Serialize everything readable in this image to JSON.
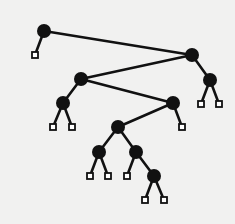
{
  "diagram": {
    "type": "binary-tree",
    "background": "#f1f1f0",
    "ink": "#111111",
    "leaf_fill": "#ffffff",
    "internal_node_radius": 7,
    "leaf_size": 6,
    "edge_width": 2.6,
    "internal_nodes": [
      {
        "id": "A",
        "x": 44,
        "y": 31
      },
      {
        "id": "B",
        "x": 192,
        "y": 55
      },
      {
        "id": "C",
        "x": 81,
        "y": 79
      },
      {
        "id": "D",
        "x": 210,
        "y": 80
      },
      {
        "id": "E",
        "x": 63,
        "y": 103
      },
      {
        "id": "F",
        "x": 173,
        "y": 103
      },
      {
        "id": "G",
        "x": 118,
        "y": 127
      },
      {
        "id": "H",
        "x": 99,
        "y": 152
      },
      {
        "id": "I",
        "x": 136,
        "y": 152
      },
      {
        "id": "J",
        "x": 154,
        "y": 176
      }
    ],
    "leaves": [
      {
        "id": "L1",
        "x": 35,
        "y": 55
      },
      {
        "id": "L2",
        "x": 201,
        "y": 104
      },
      {
        "id": "L3",
        "x": 219,
        "y": 104
      },
      {
        "id": "L4",
        "x": 53,
        "y": 127
      },
      {
        "id": "L5",
        "x": 72,
        "y": 127
      },
      {
        "id": "L6",
        "x": 182,
        "y": 127
      },
      {
        "id": "L7",
        "x": 90,
        "y": 176
      },
      {
        "id": "L8",
        "x": 108,
        "y": 176
      },
      {
        "id": "L9",
        "x": 127,
        "y": 176
      },
      {
        "id": "L10",
        "x": 145,
        "y": 200
      },
      {
        "id": "L11",
        "x": 164,
        "y": 200
      }
    ],
    "edges": [
      [
        "A",
        "L1"
      ],
      [
        "A",
        "B"
      ],
      [
        "B",
        "C"
      ],
      [
        "B",
        "D"
      ],
      [
        "D",
        "L2"
      ],
      [
        "D",
        "L3"
      ],
      [
        "C",
        "E"
      ],
      [
        "C",
        "F"
      ],
      [
        "E",
        "L4"
      ],
      [
        "E",
        "L5"
      ],
      [
        "F",
        "G"
      ],
      [
        "F",
        "L6"
      ],
      [
        "G",
        "H"
      ],
      [
        "G",
        "I"
      ],
      [
        "H",
        "L7"
      ],
      [
        "H",
        "L8"
      ],
      [
        "I",
        "L9"
      ],
      [
        "I",
        "J"
      ],
      [
        "J",
        "L10"
      ],
      [
        "J",
        "L11"
      ]
    ]
  }
}
